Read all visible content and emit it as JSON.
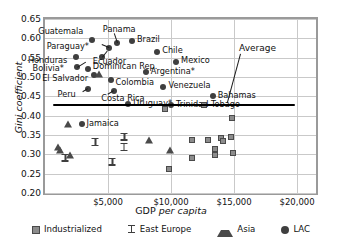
{
  "chart_data": {
    "type": "scatter",
    "title": "",
    "xlabel": "GDP per capita",
    "ylabel": "Gini coefficient",
    "xlim": [
      0,
      21500
    ],
    "ylim": [
      0.2,
      0.65
    ],
    "xticks": [
      "$5,000",
      "$10,000",
      "$15,000",
      "$20,000"
    ],
    "xtick_values": [
      5000,
      10000,
      15000,
      20000
    ],
    "yticks": [
      "0.20",
      "0.25",
      "0.30",
      "0.35",
      "0.40",
      "0.45",
      "0.50",
      "0.55",
      "0.60",
      "0.65"
    ],
    "ytick_values": [
      0.2,
      0.25,
      0.3,
      0.35,
      0.4,
      0.45,
      0.5,
      0.55,
      0.6,
      0.65
    ],
    "grid": "horizontal-and-vertical",
    "legend_position": "bottom",
    "legend": [
      {
        "name": "Industrialized",
        "marker": "square",
        "color": "#8c8c8c"
      },
      {
        "name": "East Europe",
        "marker": "ibar",
        "color": "#3f3f3f"
      },
      {
        "name": "Asia",
        "marker": "triangle",
        "color": "#4a4a4a"
      },
      {
        "name": "LAC",
        "marker": "circle",
        "color": "#3f3f3f"
      }
    ],
    "annotations": [
      {
        "text": "Average",
        "x": 15400,
        "y": 0.573,
        "leader_to_x": 14500,
        "leader_to_y": 0.432
      }
    ],
    "reference_line": {
      "label": "Average",
      "y": 0.428,
      "x_start": 600,
      "x_end": 19800,
      "color": "#000000"
    },
    "series": [
      {
        "name": "LAC",
        "marker": "circle",
        "points": [
          {
            "label": "Guatemala",
            "x": 3750,
            "y": 0.596,
            "label_dx": -54,
            "label_dy": -9
          },
          {
            "label": "Panama",
            "x": 5700,
            "y": 0.588,
            "label_dx": -14,
            "label_dy": -14
          },
          {
            "label": "Brazil",
            "x": 6900,
            "y": 0.592,
            "label_dx": 5,
            "label_dy": -2
          },
          {
            "label": "Paraguay*",
            "x": 5050,
            "y": 0.575,
            "label_dx": -62,
            "label_dy": -2
          },
          {
            "label": "Chile",
            "x": 8900,
            "y": 0.565,
            "label_dx": 5,
            "label_dy": -2
          },
          {
            "label": "Honduras",
            "x": 2450,
            "y": 0.553,
            "label_dx": -48,
            "label_dy": 3
          },
          {
            "label": "Ecuador",
            "x": 4500,
            "y": 0.551,
            "label_dx": -9,
            "label_dy": 4
          },
          {
            "label": "Mexico",
            "x": 10400,
            "y": 0.539,
            "label_dx": 5,
            "label_dy": -2
          },
          {
            "label": "Bolivia*",
            "x": 2500,
            "y": 0.525,
            "label_dx": -44,
            "label_dy": 1
          },
          {
            "label": "Dominican Rep.",
            "x": 3400,
            "y": 0.521,
            "label_dx": 5,
            "label_dy": -3
          },
          {
            "label": "Argentina*",
            "x": 8000,
            "y": 0.512,
            "label_dx": 5,
            "label_dy": -1
          },
          {
            "label": "El Salvador",
            "x": 3900,
            "y": 0.505,
            "label_dx": -52,
            "label_dy": 3
          },
          {
            "label": "Colombia",
            "x": 5200,
            "y": 0.492,
            "label_dx": 5,
            "label_dy": 2
          },
          {
            "label": "Venezuela",
            "x": 9400,
            "y": 0.474,
            "label_dx": 5,
            "label_dy": -2
          },
          {
            "label": "Peru",
            "x": 3450,
            "y": 0.47,
            "label_dx": -31,
            "label_dy": 5
          },
          {
            "label": "Costa Rica",
            "x": 5500,
            "y": 0.465,
            "label_dx": -13,
            "label_dy": 7
          },
          {
            "label": "Uruguay*",
            "x": 6600,
            "y": 0.43,
            "label_dx": 5,
            "label_dy": -1
          },
          {
            "label": "Bahamas",
            "x": 13300,
            "y": 0.45,
            "label_dx": 5,
            "label_dy": -1
          },
          {
            "label": "Trinidad Tobago",
            "x": 10000,
            "y": 0.428,
            "label_dx": 5,
            "label_dy": -1
          },
          {
            "label": "Jamaica",
            "x": 2900,
            "y": 0.378,
            "label_dx": 5,
            "label_dy": -1
          }
        ]
      },
      {
        "name": "Asia",
        "marker": "triangle",
        "points": [
          {
            "label": "",
            "x": 4300,
            "y": 0.508
          },
          {
            "label": "",
            "x": 1800,
            "y": 0.378
          },
          {
            "label": "",
            "x": 1000,
            "y": 0.318
          },
          {
            "label": "",
            "x": 1200,
            "y": 0.311
          },
          {
            "label": "",
            "x": 1950,
            "y": 0.299
          },
          {
            "label": "",
            "x": 8250,
            "y": 0.338
          },
          {
            "label": "",
            "x": 9900,
            "y": 0.31
          }
        ]
      },
      {
        "name": "East Europe",
        "marker": "ibar",
        "points": [
          {
            "label": "",
            "x": 4000,
            "y": 0.332
          },
          {
            "label": "",
            "x": 1600,
            "y": 0.291
          },
          {
            "label": "",
            "x": 6300,
            "y": 0.346
          },
          {
            "label": "",
            "x": 6250,
            "y": 0.319
          },
          {
            "label": "",
            "x": 5350,
            "y": 0.281
          }
        ]
      },
      {
        "name": "Industrialized",
        "marker": "square",
        "points": [
          {
            "label": "",
            "x": 9800,
            "y": 0.262
          },
          {
            "label": "",
            "x": 9550,
            "y": 0.417
          },
          {
            "label": "",
            "x": 12600,
            "y": 0.428
          },
          {
            "label": "",
            "x": 14800,
            "y": 0.395
          },
          {
            "label": "",
            "x": 11700,
            "y": 0.338
          },
          {
            "label": "",
            "x": 12900,
            "y": 0.338
          },
          {
            "label": "",
            "x": 14000,
            "y": 0.343
          },
          {
            "label": "",
            "x": 14150,
            "y": 0.334
          },
          {
            "label": "",
            "x": 14750,
            "y": 0.344
          },
          {
            "label": "",
            "x": 13450,
            "y": 0.314
          },
          {
            "label": "",
            "x": 11650,
            "y": 0.291
          },
          {
            "label": "",
            "x": 13500,
            "y": 0.297
          },
          {
            "label": "",
            "x": 14900,
            "y": 0.303
          }
        ]
      }
    ]
  }
}
